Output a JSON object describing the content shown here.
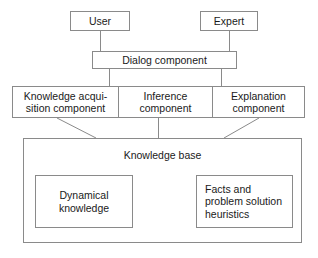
{
  "diagram": {
    "type": "block-diagram",
    "nodes": {
      "user": "User",
      "expert": "Expert",
      "dialog": "Dialog component",
      "knowledge_acquisition": "Knowledge acqui-\nsition component",
      "inference": "Inference\ncomponent",
      "explanation": "Explanation\ncomponent",
      "knowledge_base": "Knowledge base",
      "dynamical_knowledge": "Dynamical\nknowledge",
      "facts_heuristics": "Facts and\nproblem solution\nheuristics"
    },
    "colors": {
      "stroke": "#8a8a8a",
      "text": "#1a1a1a",
      "background": "#ffffff",
      "connector": "#8a8a8a"
    },
    "connections": [
      {
        "from": "user",
        "to": "dialog",
        "style": "vertical"
      },
      {
        "from": "expert",
        "to": "dialog",
        "style": "vertical"
      },
      {
        "from": "dialog",
        "to": "knowledge_acquisition",
        "style": "vertical"
      },
      {
        "from": "dialog",
        "to": "explanation",
        "style": "vertical"
      },
      {
        "from": "knowledge_acquisition",
        "to": "knowledge_base",
        "style": "diagonal"
      },
      {
        "from": "inference",
        "to": "knowledge_base",
        "style": "vertical"
      },
      {
        "from": "explanation",
        "to": "knowledge_base",
        "style": "diagonal"
      }
    ]
  }
}
